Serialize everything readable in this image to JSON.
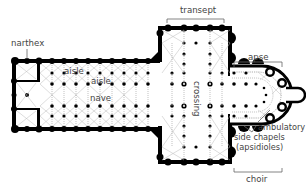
{
  "labels": {
    "narthex": "narthex",
    "transept": "transept",
    "aisle_outer": "aisle",
    "aisle_inner": "aisle",
    "nave": "nave",
    "crossing": "crossing",
    "apse": "apse",
    "ambulatory": "ambulatory",
    "side_chapels": "side chapels",
    "apsidioles": "(apsidioles)",
    "choir": "choir"
  },
  "colors": {
    "walls": "#000000",
    "labels": "#444444",
    "leader_lines": "#666666",
    "vault_ribs": "#bbbbbb",
    "background": "#ffffff"
  }
}
